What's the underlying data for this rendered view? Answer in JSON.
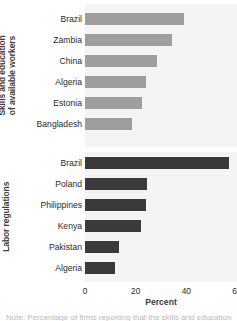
{
  "chart_data": {
    "type": "bar",
    "orientation": "horizontal",
    "title": "",
    "xlabel": "Percent",
    "ylabel": "",
    "xlim": [
      0,
      60
    ],
    "xticks": [
      0,
      20,
      40,
      60
    ],
    "xticklabels": [
      "0",
      "20",
      "40",
      "60"
    ],
    "grid": false,
    "legend": "none",
    "panels": [
      {
        "name": "skills-and-education",
        "group_label": "Skills and education of available workers",
        "group_label_lines": [
          "Skills and education",
          "of available workers"
        ],
        "color": "#9e9e9e",
        "categories": [
          "Brazil",
          "Zambia",
          "China",
          "Algeria",
          "Estonia",
          "Bangladesh"
        ],
        "values": [
          39,
          34.5,
          28.5,
          24,
          22.5,
          18.5
        ]
      },
      {
        "name": "labor-regulations",
        "group_label": "Labor regulations",
        "group_label_lines": [
          "Labor regulations"
        ],
        "color": "#3a3a3a",
        "categories": [
          "Brazil",
          "Poland",
          "Philippines",
          "Kenya",
          "Pakistan",
          "Algeria"
        ],
        "values": [
          57,
          24.5,
          24,
          22,
          13.5,
          12
        ]
      }
    ]
  },
  "caption": {
    "sliver_text": "Note: Percentage of firms reporting that the skills and education of"
  },
  "colors": {
    "panel_background": "#f4f4f4",
    "page_background": "#ffffff",
    "bar_skills": "#9e9e9e",
    "bar_labor": "#3a3a3a",
    "text": "#2b2b2b"
  }
}
